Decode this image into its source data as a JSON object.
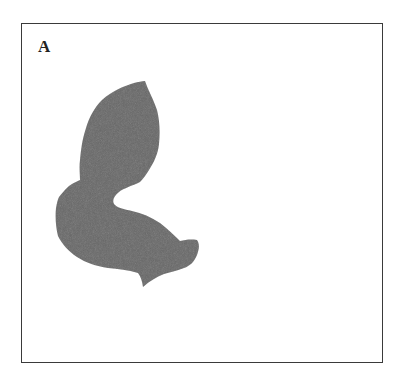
{
  "figure": {
    "panel_label": "A",
    "frame": {
      "border_color": "#3a3a3a",
      "background": "#ffffff"
    },
    "region": {
      "fill": "#686868",
      "description": "irregular segmented region (single dark-gray blob)"
    }
  }
}
